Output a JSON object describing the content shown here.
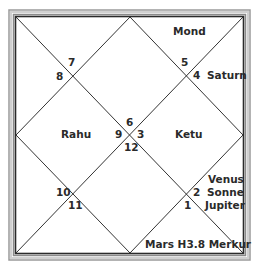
{
  "chart": {
    "type": "north-indian-horoscope",
    "frame_color": "#3a3a3a",
    "line_color": "#333333"
  },
  "houses": [
    {
      "number": "7",
      "planets": []
    },
    {
      "number": "8",
      "planets": []
    },
    {
      "number": "5",
      "planets": [
        "Mond"
      ]
    },
    {
      "number": "4",
      "planets": [
        "Saturn"
      ]
    },
    {
      "number": "6",
      "planets": []
    },
    {
      "number": "9",
      "planets": [
        "Rahu"
      ]
    },
    {
      "number": "3",
      "planets": [
        "Ketu"
      ]
    },
    {
      "number": "12",
      "planets": []
    },
    {
      "number": "10",
      "planets": []
    },
    {
      "number": "11",
      "planets": []
    },
    {
      "number": "2",
      "planets": [
        "Venus",
        "Sonne",
        "Jupiter"
      ]
    },
    {
      "number": "1",
      "planets": [
        "Mars H3.8 Merkur"
      ]
    }
  ],
  "labels": {
    "mond": "Mond",
    "saturn": "Saturn",
    "rahu": "Rahu",
    "ketu": "Ketu",
    "venus": "Venus",
    "sonne": "Sonne",
    "jupiter": "Jupiter",
    "bottom": "Mars H3.8 Merkur"
  },
  "numbers": {
    "n7": "7",
    "n8": "8",
    "n5": "5",
    "n4": "4",
    "n6": "6",
    "n9": "9",
    "n3": "3",
    "n12": "12",
    "n10": "10",
    "n11": "11",
    "n2": "2",
    "n1": "1"
  }
}
